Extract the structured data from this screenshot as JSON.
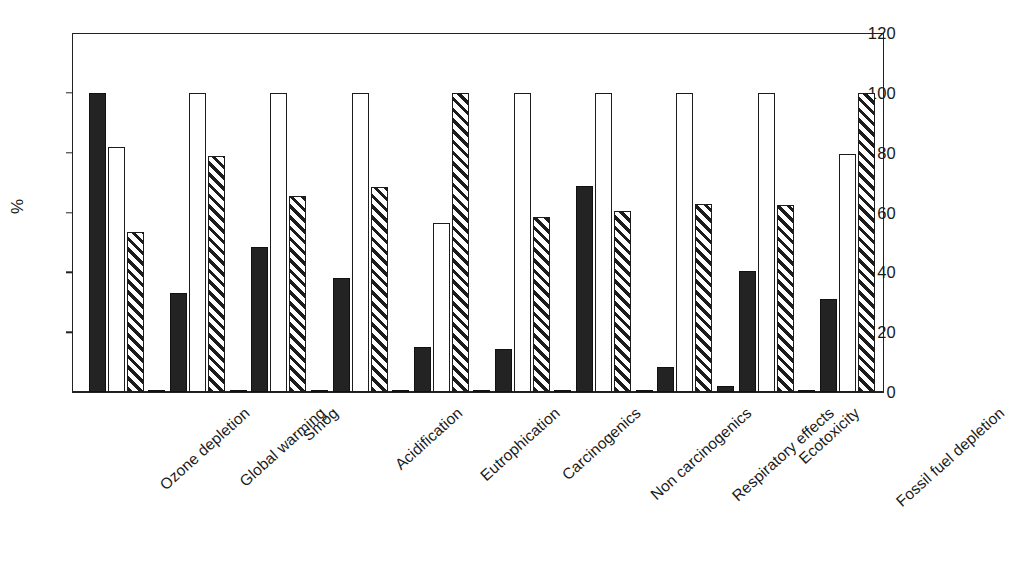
{
  "figure": {
    "cropped_header_text": "",
    "background": "#ffffff",
    "ink_color": "#1c1c1c"
  },
  "axis": {
    "ylabel": "%",
    "yticks": [
      0,
      20,
      40,
      60,
      80,
      100,
      120
    ],
    "ytick_labels": [
      "0",
      "20",
      "40",
      "60",
      "80",
      "100",
      "120"
    ]
  },
  "chart_data": {
    "type": "bar",
    "title": "",
    "xlabel": "",
    "ylabel": "%",
    "ylim": [
      0,
      120
    ],
    "grid": false,
    "legend_position": "none",
    "categories": [
      "Ozone depletion",
      "Global warming",
      "Smog",
      "Acidification",
      "Eutrophication",
      "Carcinogenics",
      "Non carcinogenics",
      "Respiratory effects",
      "Ecotoxicity",
      "Fossil fuel depletion"
    ],
    "series": [
      {
        "name": "Series 1",
        "style": "solid-black",
        "color": "#232323",
        "values": [
          100,
          0.5,
          0.4,
          0.5,
          0.4,
          0.5,
          0.6,
          0.4,
          2,
          0.5
        ]
      },
      {
        "name": "Series 2",
        "style": "solid-black",
        "color": "#232323",
        "values": [
          null,
          33,
          48.5,
          38,
          15,
          14.5,
          69,
          8.5,
          40.5,
          31
        ]
      },
      {
        "name": "Series 3",
        "style": "hollow-white",
        "color": "#ffffff",
        "values": [
          82,
          100,
          100,
          100,
          56.5,
          100,
          100,
          100,
          100,
          79.5
        ]
      },
      {
        "name": "Series 4",
        "style": "diagonal-hatch",
        "color": "#1c1c1c",
        "values": [
          53.5,
          79,
          65.5,
          68.5,
          100,
          58.5,
          60.5,
          63,
          62.5,
          100
        ]
      }
    ]
  }
}
